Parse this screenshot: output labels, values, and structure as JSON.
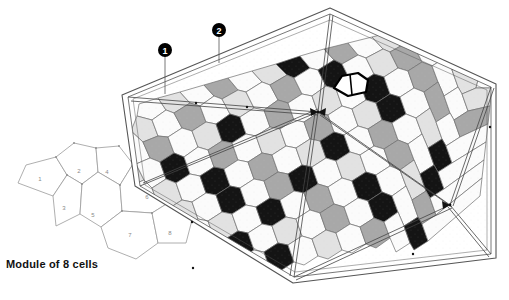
{
  "figure": {
    "caption": "Module of 8 cells",
    "background_color": "#ffffff"
  },
  "module": {
    "name": "module-of-8-cells",
    "stroke_color": "#9a9a9a",
    "label_color": "#8a8a8a",
    "cells": [
      {
        "id": "1",
        "label": "1",
        "cx": 40,
        "cy": 179
      },
      {
        "id": "2",
        "label": "2",
        "cx": 79,
        "cy": 171
      },
      {
        "id": "3",
        "label": "3",
        "cx": 64,
        "cy": 208
      },
      {
        "id": "4",
        "label": "4",
        "cx": 107,
        "cy": 172
      },
      {
        "id": "5",
        "label": "5",
        "cx": 93,
        "cy": 215
      },
      {
        "id": "6",
        "label": "6",
        "cx": 147,
        "cy": 197
      },
      {
        "id": "7",
        "label": "7",
        "cx": 130,
        "cy": 235
      },
      {
        "id": "8",
        "label": "8",
        "cx": 170,
        "cy": 233
      }
    ]
  },
  "callouts": [
    {
      "id": "callout-1",
      "label": "1",
      "cx": 165,
      "cy": 50,
      "line_to_y": 94,
      "color": "#000000"
    },
    {
      "id": "callout-2",
      "label": "2",
      "cx": 219,
      "cy": 30,
      "line_to_y": 63,
      "color": "#000000"
    }
  ],
  "dome": {
    "name": "cell-dome",
    "highlight": {
      "name": "highlighted-cell",
      "stroke_color": "#000000",
      "fill_color": "#ffffff"
    },
    "palette": {
      "white": "#fbfbfb",
      "light_gray": "#e2e2e2",
      "mid_gray": "#a8a8a8",
      "dark_gray": "#787878",
      "black": "#141414",
      "cell_stroke": "#6f6f6f",
      "rim_stroke": "#555555",
      "rib_stroke": "#444444"
    }
  }
}
